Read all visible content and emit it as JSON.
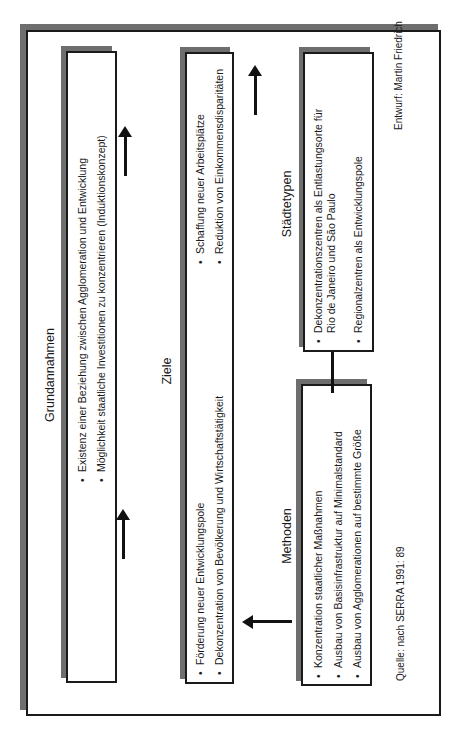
{
  "diagram": {
    "orientation": "rotated 90° counter-clockwise",
    "boxes": {
      "grundannahmen": {
        "title": "Grundannahmen",
        "items": [
          "Existenz einer Beziehung zwischen Agglomeration und Entwicklung",
          "Möglichkeit staatliche Investitionen zu konzentrieren (Induktionskonzept)"
        ]
      },
      "ziele": {
        "title": "Ziele",
        "items": [
          "Förderung neuer Entwicklungspole",
          "Dekonzentration von Bevölkerung und Wirtschaftstätigkeit",
          "Schaffung neuer Arbeitsplätze",
          "Reduktion von Einkommensdisparitäten"
        ]
      },
      "methoden": {
        "title": "Methoden",
        "items": [
          "Konzentration staatlicher Maßnahmen",
          "Ausbau von Basisinfrastruktur auf Minimalstandard",
          "Ausbau von Agglomerationen auf bestimmte Größe"
        ]
      },
      "staedtetypen": {
        "title": "Städtetypen",
        "items": [
          "Dekonzentrationszentren als Entlastungsorte für",
          "Rio de Janeiro und São Paulo",
          "Regionalzentren als Entwicklungspole"
        ]
      }
    },
    "arrows": [
      {
        "from": "Grundannahmen",
        "to": "Ziele"
      },
      {
        "from": "Grundannahmen",
        "to": "Ziele"
      },
      {
        "from": "Ziele",
        "to": "Städtetypen"
      },
      {
        "from": "Methoden",
        "to": "Ziele"
      },
      {
        "from": "Methoden",
        "to": "Städtetypen"
      }
    ],
    "source": "Quelle: nach SERRA 1991: 89",
    "author": "Entwurf: Martin Friedrich",
    "colors": {
      "border": "#1a1a1a",
      "shadow": "#6e6e6e",
      "background": "#ffffff"
    }
  }
}
